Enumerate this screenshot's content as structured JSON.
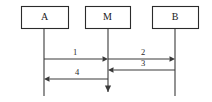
{
  "diagram": {
    "kind": "uml-sequence-diagram",
    "width": 212,
    "height": 102,
    "background_color": "#ffffff",
    "line_color": "#3a3a3a",
    "box_stroke_color": "#2b2b2b",
    "text_color": "#1a1a1a",
    "participants": [
      {
        "id": "a",
        "label": "A",
        "box": {
          "x": 21,
          "y": 6,
          "width": 47,
          "height": 22
        },
        "lifeline_x": 44,
        "lifeline_top": 28,
        "lifeline_bottom": 96,
        "terminator": "open"
      },
      {
        "id": "m",
        "label": "M",
        "box": {
          "x": 85,
          "y": 6,
          "width": 45,
          "height": 22
        },
        "lifeline_x": 108,
        "lifeline_top": 28,
        "lifeline_bottom": 92,
        "terminator": "arrow-down"
      },
      {
        "id": "b",
        "label": "B",
        "box": {
          "x": 152,
          "y": 6,
          "width": 46,
          "height": 22
        },
        "lifeline_x": 175,
        "lifeline_top": 28,
        "lifeline_bottom": 96,
        "terminator": "open"
      }
    ],
    "messages": [
      {
        "id": "msg-1",
        "label": "1",
        "from": "a",
        "to": "m",
        "direction": "right",
        "y": 59,
        "x_start": 44,
        "x_end": 108,
        "label_x": 75,
        "label_y": 55
      },
      {
        "id": "msg-2",
        "label": "2",
        "from": "m",
        "to": "b",
        "direction": "right",
        "y": 59,
        "x_start": 108,
        "x_end": 175,
        "label_x": 143,
        "label_y": 55
      },
      {
        "id": "msg-3",
        "label": "3",
        "from": "b",
        "to": "m",
        "direction": "left",
        "y": 70,
        "x_start": 175,
        "x_end": 108,
        "label_x": 143,
        "label_y": 66
      },
      {
        "id": "msg-4",
        "label": "4",
        "from": "m",
        "to": "a",
        "direction": "left",
        "y": 79,
        "x_start": 108,
        "x_end": 44,
        "label_x": 77,
        "label_y": 75
      }
    ]
  }
}
